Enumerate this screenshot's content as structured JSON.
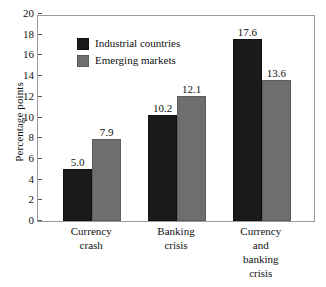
{
  "chart_data": {
    "type": "bar",
    "title": "",
    "xlabel": "",
    "ylabel": "Percentage points",
    "ylim": [
      0,
      20
    ],
    "ytick_step": 2,
    "yticks": [
      20,
      18,
      16,
      14,
      12,
      10,
      8,
      6,
      4,
      2,
      0
    ],
    "grid": false,
    "legend_position": "upper-left-inside",
    "categories": [
      "Currency\ncrash",
      "Banking\ncrisis",
      "Currency\nand\nbanking\ncrisis"
    ],
    "series": [
      {
        "name": "Industrial countries",
        "color": "#1a1a1a",
        "values": [
          5.0,
          7.9999,
          17.6
        ],
        "labels": [
          "5.0",
          "10.2",
          "17.6"
        ],
        "true_values": [
          5.0,
          10.2,
          17.6
        ]
      },
      {
        "name": "Emerging markets",
        "color": "#6e6e6e",
        "values": [
          7.9,
          12.1,
          13.6
        ],
        "labels": [
          "7.9",
          "12.1",
          "13.6"
        ],
        "true_values": [
          7.9,
          12.1,
          13.6
        ]
      }
    ],
    "bar_value_labels": [
      [
        "5.0",
        "7.9"
      ],
      [
        "10.2",
        "12.1"
      ],
      [
        "17.6",
        "13.6"
      ]
    ]
  },
  "legend": {
    "items": [
      {
        "label": "Industrial countries",
        "swatch": "dark"
      },
      {
        "label": "Emerging markets",
        "swatch": "gray"
      }
    ]
  },
  "axes": {
    "y_title": "Percentage points",
    "y_ticks": [
      "20",
      "18",
      "16",
      "14",
      "12",
      "10",
      "8",
      "6",
      "4",
      "2",
      "0"
    ]
  },
  "colors": {
    "industrial": "#1a1a1a",
    "emerging": "#6e6e6e",
    "frame": "#9a9a9a",
    "background": "#ffffff",
    "text": "#111111"
  }
}
